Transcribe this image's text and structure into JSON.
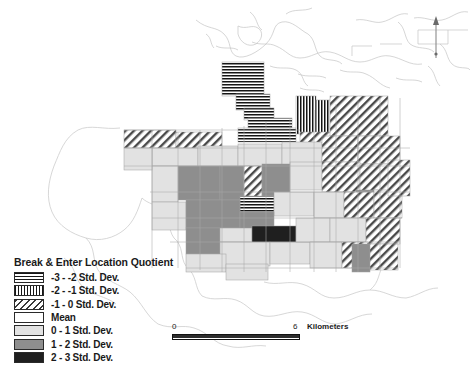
{
  "map": {
    "title": "Break & Enter Location Quotient choropleth map",
    "background_color": "#ffffff",
    "coastline_color": "#c9c9c9",
    "boundary_color": "#9a9a9a",
    "north_arrow": {
      "name": "north-arrow",
      "x": 436,
      "y": 16,
      "height": 42
    }
  },
  "legend": {
    "title": "Break & Enter Location Quotient",
    "entries": [
      {
        "label": "-3 - -2 Std. Dev.",
        "pattern": "horizontal-lines",
        "color": "#ffffff",
        "ink": "#151515"
      },
      {
        "label": "-2 - -1 Std. Dev.",
        "pattern": "vertical-lines",
        "color": "#ffffff",
        "ink": "#151515"
      },
      {
        "label": "-1 - 0 Std. Dev.",
        "pattern": "diagonal-hatch",
        "color": "#ffffff",
        "ink": "#3a3a3a"
      },
      {
        "label": "Mean",
        "pattern": "solid",
        "color": "#ffffff",
        "ink": "#ffffff"
      },
      {
        "label": "0 - 1 Std. Dev.",
        "pattern": "solid",
        "color": "#e2e2e2",
        "ink": "#e2e2e2"
      },
      {
        "label": "1 - 2 Std. Dev.",
        "pattern": "solid",
        "color": "#8e8e8e",
        "ink": "#8e8e8e"
      },
      {
        "label": "2 - 3 Std. Dev.",
        "pattern": "solid",
        "color": "#1f1f1f",
        "ink": "#1f1f1f"
      }
    ]
  },
  "scalebar": {
    "min_label": "0",
    "max_label": "6",
    "units": "Kilometers",
    "length_px": 128
  },
  "chart_data": {
    "type": "map",
    "title": "Break & Enter Location Quotient",
    "classification": "standard-deviation",
    "class_count": 7,
    "class_breaks": [
      -3,
      -2,
      -1,
      0,
      1,
      2,
      3
    ],
    "class_labels": [
      "-3 - -2 Std. Dev.",
      "-2 - -1 Std. Dev.",
      "-1 - 0 Std. Dev.",
      "Mean",
      "0 - 1 Std. Dev.",
      "1 - 2 Std. Dev.",
      "2 - 3 Std. Dev."
    ],
    "scale": {
      "min": 0,
      "max": 6,
      "units": "Kilometers"
    },
    "regions": [
      {
        "id": "r1",
        "x": 222,
        "y": 62,
        "w": 42,
        "h": 34,
        "cls": 0
      },
      {
        "id": "r2",
        "x": 236,
        "y": 94,
        "w": 34,
        "h": 16,
        "cls": 0
      },
      {
        "id": "r3",
        "x": 244,
        "y": 108,
        "w": 30,
        "h": 12,
        "cls": 0
      },
      {
        "id": "r4",
        "x": 248,
        "y": 118,
        "w": 44,
        "h": 14,
        "cls": 0
      },
      {
        "id": "r5",
        "x": 238,
        "y": 128,
        "w": 58,
        "h": 14,
        "cls": 0
      },
      {
        "id": "r6",
        "x": 296,
        "y": 96,
        "w": 20,
        "h": 38,
        "cls": 1
      },
      {
        "id": "r7",
        "x": 316,
        "y": 100,
        "w": 14,
        "h": 34,
        "cls": 1
      },
      {
        "id": "r8",
        "x": 300,
        "y": 132,
        "w": 34,
        "h": 12,
        "cls": 2
      },
      {
        "id": "r9",
        "x": 330,
        "y": 96,
        "w": 58,
        "h": 40,
        "cls": 2
      },
      {
        "id": "r10",
        "x": 124,
        "y": 130,
        "w": 52,
        "h": 18,
        "cls": 2
      },
      {
        "id": "r11",
        "x": 176,
        "y": 132,
        "w": 46,
        "h": 16,
        "cls": 2
      },
      {
        "id": "r12",
        "x": 152,
        "y": 148,
        "w": 46,
        "h": 18,
        "cls": 4
      },
      {
        "id": "r13",
        "x": 198,
        "y": 146,
        "w": 40,
        "h": 20,
        "cls": 4
      },
      {
        "id": "r14",
        "x": 238,
        "y": 144,
        "w": 44,
        "h": 22,
        "cls": 4
      },
      {
        "id": "r15",
        "x": 282,
        "y": 142,
        "w": 40,
        "h": 24,
        "cls": 4
      },
      {
        "id": "r16",
        "x": 322,
        "y": 136,
        "w": 36,
        "h": 26,
        "cls": 2
      },
      {
        "id": "r17",
        "x": 358,
        "y": 136,
        "w": 42,
        "h": 28,
        "cls": 2
      },
      {
        "id": "r18",
        "x": 178,
        "y": 166,
        "w": 42,
        "h": 34,
        "cls": 5
      },
      {
        "id": "r19",
        "x": 220,
        "y": 166,
        "w": 24,
        "h": 34,
        "cls": 5
      },
      {
        "id": "r20",
        "x": 244,
        "y": 166,
        "w": 18,
        "h": 32,
        "cls": 2
      },
      {
        "id": "r21",
        "x": 262,
        "y": 164,
        "w": 28,
        "h": 36,
        "cls": 5
      },
      {
        "id": "r22",
        "x": 290,
        "y": 162,
        "w": 32,
        "h": 28,
        "cls": 4
      },
      {
        "id": "r23",
        "x": 322,
        "y": 162,
        "w": 38,
        "h": 30,
        "cls": 2
      },
      {
        "id": "r24",
        "x": 360,
        "y": 164,
        "w": 40,
        "h": 30,
        "cls": 2
      },
      {
        "id": "r25",
        "x": 152,
        "y": 166,
        "w": 26,
        "h": 36,
        "cls": 4
      },
      {
        "id": "r26",
        "x": 356,
        "y": 190,
        "w": 22,
        "h": 14,
        "cls": 5
      },
      {
        "id": "r27",
        "x": 240,
        "y": 196,
        "w": 34,
        "h": 16,
        "cls": 0
      },
      {
        "id": "r28",
        "x": 274,
        "y": 192,
        "w": 40,
        "h": 24,
        "cls": 4
      },
      {
        "id": "r29",
        "x": 152,
        "y": 202,
        "w": 34,
        "h": 28,
        "cls": 4
      },
      {
        "id": "r30",
        "x": 186,
        "y": 200,
        "w": 54,
        "h": 28,
        "cls": 5
      },
      {
        "id": "r31",
        "x": 240,
        "y": 212,
        "w": 34,
        "h": 18,
        "cls": 5
      },
      {
        "id": "r32",
        "x": 314,
        "y": 192,
        "w": 30,
        "h": 26,
        "cls": 4
      },
      {
        "id": "r33",
        "x": 344,
        "y": 192,
        "w": 30,
        "h": 26,
        "cls": 2
      },
      {
        "id": "r34",
        "x": 374,
        "y": 190,
        "w": 28,
        "h": 28,
        "cls": 2
      },
      {
        "id": "r35",
        "x": 186,
        "y": 228,
        "w": 34,
        "h": 26,
        "cls": 5
      },
      {
        "id": "r36",
        "x": 220,
        "y": 228,
        "w": 32,
        "h": 14,
        "cls": 4
      },
      {
        "id": "r37",
        "x": 252,
        "y": 226,
        "w": 44,
        "h": 18,
        "cls": 6
      },
      {
        "id": "r38",
        "x": 220,
        "y": 242,
        "w": 50,
        "h": 24,
        "cls": 4
      },
      {
        "id": "r39",
        "x": 270,
        "y": 242,
        "w": 40,
        "h": 22,
        "cls": 4
      },
      {
        "id": "r40",
        "x": 296,
        "y": 218,
        "w": 34,
        "h": 24,
        "cls": 4
      },
      {
        "id": "r41",
        "x": 330,
        "y": 218,
        "w": 36,
        "h": 24,
        "cls": 4
      },
      {
        "id": "r42",
        "x": 366,
        "y": 218,
        "w": 34,
        "h": 26,
        "cls": 2
      },
      {
        "id": "r43",
        "x": 310,
        "y": 242,
        "w": 32,
        "h": 26,
        "cls": 4
      },
      {
        "id": "r44",
        "x": 342,
        "y": 242,
        "w": 26,
        "h": 26,
        "cls": 2
      },
      {
        "id": "r45",
        "x": 368,
        "y": 244,
        "w": 30,
        "h": 26,
        "cls": 2
      },
      {
        "id": "r46",
        "x": 352,
        "y": 244,
        "w": 18,
        "h": 28,
        "cls": 5
      },
      {
        "id": "r47",
        "x": 124,
        "y": 148,
        "w": 28,
        "h": 22,
        "cls": 4
      },
      {
        "id": "r48",
        "x": 186,
        "y": 254,
        "w": 40,
        "h": 18,
        "cls": 4
      },
      {
        "id": "r49",
        "x": 226,
        "y": 264,
        "w": 42,
        "h": 16,
        "cls": 4
      },
      {
        "id": "r50",
        "x": 388,
        "y": 160,
        "w": 22,
        "h": 36,
        "cls": 2
      }
    ]
  }
}
